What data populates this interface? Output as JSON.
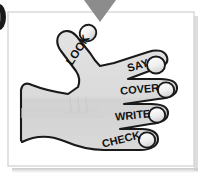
{
  "graphic": {
    "title": "Look Say Cover Write Check hand diagram",
    "panel": {
      "background_color": "#ffffff",
      "border_color": "#d8d8d8",
      "shadow_color": "#c9c9c9"
    },
    "pointer_triangle": {
      "name": "down-arrow-triangle",
      "color": "#8c8c8c"
    },
    "left_edge_mark": {
      "name": "dark-ellipse-edge-mark",
      "color": "#1a1a1a"
    },
    "hand": {
      "fill_color": "#dcdcdc",
      "outline_color": "#1a1a1a",
      "fingertip_fill": "#f2f2f2"
    },
    "steps": [
      {
        "id": "look",
        "label": "LOOK",
        "rotation": -57
      },
      {
        "id": "say",
        "label": "SAY",
        "rotation": -16
      },
      {
        "id": "cover",
        "label": "COVER",
        "rotation": -5
      },
      {
        "id": "write",
        "label": "WRITE",
        "rotation": -6
      },
      {
        "id": "check",
        "label": "CHECK",
        "rotation": -14
      }
    ]
  }
}
